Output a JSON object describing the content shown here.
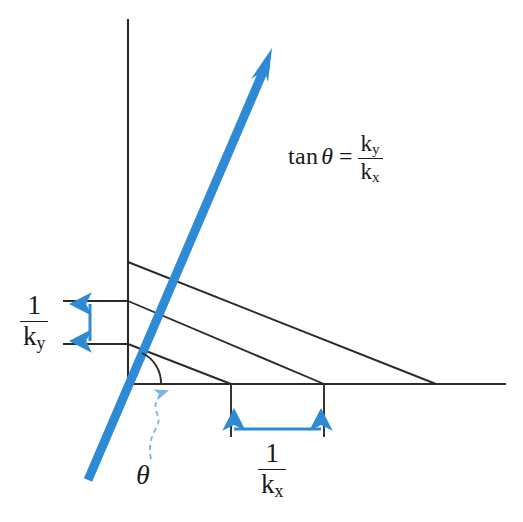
{
  "figure": {
    "background_color": "#ffffff"
  },
  "colors": {
    "accent_blue": "#2e8ad4",
    "dashed_blue": "#79b4e4",
    "line_black": "#2a2a2a",
    "text_black": "#1a1a1a"
  },
  "labels": {
    "one_over_ky": {
      "numerator": "1",
      "denominator": "k",
      "denominator_sub": "y"
    },
    "one_over_kx": {
      "numerator": "1",
      "denominator": "k",
      "denominator_sub": "x"
    },
    "theta": "θ",
    "equation": {
      "function": "tan",
      "angle": "θ",
      "equals": "=",
      "numerator": "k",
      "numerator_sub": "y",
      "denominator": "k",
      "denominator_sub": "x"
    }
  },
  "geometry": {
    "origin": {
      "x": 128,
      "y": 384
    },
    "vertical_axis": {
      "x": 128,
      "y_top": 20,
      "y_bottom": 384
    },
    "horizontal_axis": {
      "y": 384,
      "x_left": 128,
      "x_right": 505
    },
    "wave_vector_arrow": {
      "tail": {
        "x": 88,
        "y": 480
      },
      "head": {
        "x": 272,
        "y": 50
      },
      "stroke_width": 9,
      "color": "#2e8ad4"
    },
    "wavefront_lines": [
      {
        "start": {
          "x": 128,
          "y": 262
        },
        "end": {
          "x": 436,
          "y": 384
        }
      },
      {
        "start": {
          "x": 128,
          "y": 301
        },
        "end": {
          "x": 324,
          "y": 384
        }
      },
      {
        "start": {
          "x": 128,
          "y": 344
        },
        "end": {
          "x": 231,
          "y": 384
        }
      }
    ],
    "left_tick_lines": [
      {
        "x_start": 63,
        "x_end": 128,
        "y": 301
      },
      {
        "x_start": 63,
        "x_end": 128,
        "y": 344
      }
    ],
    "bottom_drop_lines": [
      {
        "x": 231,
        "y_start": 384,
        "y_end": 437
      },
      {
        "x": 324,
        "y_start": 384,
        "y_end": 437
      }
    ],
    "ky_measure_arrow": {
      "x": 90,
      "y_top": 301,
      "y_bottom": 344,
      "double_headed": true
    },
    "kx_measure_arrow": {
      "y": 429,
      "x_left": 231,
      "x_right": 324,
      "double_headed": true
    },
    "angle_arc": {
      "center": {
        "x": 128,
        "y": 384
      },
      "radius": 33,
      "from_deg": 0,
      "to_deg": 67
    },
    "theta_leader": {
      "from": {
        "x": 152,
        "y": 462
      },
      "to": {
        "x": 168,
        "y": 394
      },
      "dashed": true
    }
  }
}
